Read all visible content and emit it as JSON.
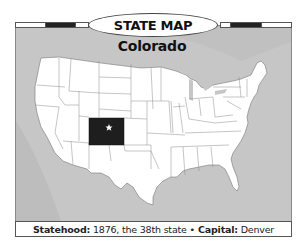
{
  "header": {
    "title": "STATE MAP"
  },
  "state": {
    "name": "Colorado",
    "highlight_color": "#1e1e1e",
    "capital_marker": "star-icon"
  },
  "caption": {
    "statehood_label": "Statehood:",
    "statehood_value": " 1876, the 38th state ",
    "separator": "•",
    "capital_label": " Capital:",
    "capital_value": " Denver"
  },
  "colors": {
    "water": "#c9c9c9",
    "land": "#ffffff",
    "border": "#6e6e6e",
    "highlight": "#1e1e1e",
    "bar_dark": "#222222"
  }
}
